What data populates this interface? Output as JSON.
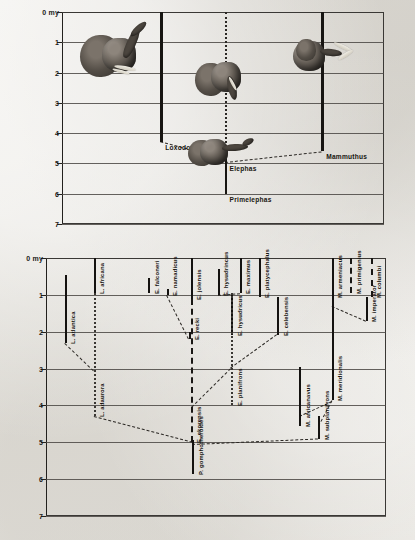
{
  "figure": {
    "axis_unit_label": "0 my",
    "tick_labels": [
      "0 my",
      "1",
      "2",
      "3",
      "4",
      "5",
      "6",
      "7"
    ],
    "colors": {
      "ink": "#171512",
      "grid": "#4a4743",
      "paper": "#e8e6e1"
    }
  },
  "chart_data": {
    "type": "range-chart",
    "title": "",
    "ylabel": "Millions of years (my)",
    "ylim": [
      0,
      7
    ],
    "y_inverted": true,
    "grid": true,
    "legend": "none",
    "panels": [
      {
        "name": "genus-panel",
        "ranges": [
          {
            "label": "Loxodonta",
            "from": 0.0,
            "to": 4.3,
            "style": "solid",
            "x_frac": 0.305
          },
          {
            "label": "Elephas",
            "from": 0.0,
            "to": 5.0,
            "style": "dotted",
            "x_frac": 0.505
          },
          {
            "label": "Mammuthus",
            "from": 0.0,
            "to": 4.6,
            "style": "solid",
            "x_frac": 0.805
          },
          {
            "label": "Primelephas",
            "from": 4.85,
            "to": 6.0,
            "style": "solid",
            "x_frac": 0.505
          }
        ],
        "lineages": [
          {
            "from": "Primelephas",
            "to": "Loxodonta",
            "x1_frac": 0.505,
            "y1": 4.85,
            "x2_frac": 0.305,
            "y2": 4.3
          },
          {
            "from": "Primelephas",
            "to": "Mammuthus",
            "x1_frac": 0.505,
            "y1": 4.95,
            "x2_frac": 0.805,
            "y2": 4.6
          }
        ],
        "illustrations": [
          {
            "name": "loxodonta-head",
            "x_frac": 0.17,
            "y": 1.45
          },
          {
            "name": "elephas-head",
            "x_frac": 0.5,
            "y": 2.25
          },
          {
            "name": "mammuthus-head",
            "x_frac": 0.82,
            "y": 1.5
          },
          {
            "name": "primelephas-head",
            "x_frac": 0.5,
            "y": 4.65
          }
        ]
      },
      {
        "name": "species-panel",
        "ranges": [
          {
            "label": "L. atlantica",
            "from": 0.45,
            "to": 2.3,
            "style": "solid",
            "x_frac": 0.055
          },
          {
            "label": "L. africana",
            "from": 0.0,
            "to": 0.95,
            "style": "solid",
            "x_frac": 0.14
          },
          {
            "label": "L. adaurora",
            "from": 0.95,
            "to": 4.3,
            "style": "dotted",
            "x_frac": 0.14
          },
          {
            "label": "E. falconeri",
            "from": 0.55,
            "to": 0.95,
            "style": "solid",
            "x_frac": 0.3
          },
          {
            "label": "E. namadicus",
            "from": 0.85,
            "to": 1.0,
            "style": "solid",
            "x_frac": 0.355
          },
          {
            "label": "E. recki",
            "from": 2.0,
            "to": 2.2,
            "style": "solid",
            "x_frac": 0.42
          },
          {
            "label": "E. jolensis",
            "from": 0.0,
            "to": 1.1,
            "style": "solid",
            "x_frac": 0.425
          },
          {
            "label": "E. ekorensis",
            "from": 1.1,
            "to": 5.0,
            "style": "dashed",
            "x_frac": 0.425
          },
          {
            "label": "E. hysudrincus",
            "from": 0.3,
            "to": 1.0,
            "style": "solid",
            "x_frac": 0.505
          },
          {
            "label": "E. hysudricus",
            "from": 1.0,
            "to": 2.1,
            "style": "solid",
            "x_frac": 0.545
          },
          {
            "label": "E. maximus",
            "from": 0.0,
            "to": 0.95,
            "style": "solid",
            "x_frac": 0.57
          },
          {
            "label": "E. planifrons",
            "from": 0.95,
            "to": 4.0,
            "style": "dotted",
            "x_frac": 0.545
          },
          {
            "label": "E. platycephalus",
            "from": 0.0,
            "to": 1.05,
            "style": "solid",
            "x_frac": 0.625
          },
          {
            "label": "E. celebensis",
            "from": 1.05,
            "to": 2.1,
            "style": "solid",
            "x_frac": 0.68
          },
          {
            "label": "M. africanavus",
            "from": 2.95,
            "to": 4.55,
            "style": "solid",
            "x_frac": 0.745
          },
          {
            "label": "M. subplanifrons",
            "from": 4.3,
            "to": 4.9,
            "style": "solid",
            "x_frac": 0.8
          },
          {
            "label": "M. armeniacus",
            "from": 0.0,
            "to": 1.05,
            "style": "solid",
            "x_frac": 0.84
          },
          {
            "label": "M. meridionalis",
            "from": 1.05,
            "to": 3.85,
            "style": "solid",
            "x_frac": 0.84
          },
          {
            "label": "M. primigenius",
            "from": 0.0,
            "to": 0.95,
            "style": "dashed",
            "x_frac": 0.895
          },
          {
            "label": "M. columbi",
            "from": 0.0,
            "to": 1.05,
            "style": "dashed",
            "x_frac": 0.955
          },
          {
            "label": "M. imperator",
            "from": 1.05,
            "to": 1.7,
            "style": "solid",
            "x_frac": 0.94
          },
          {
            "label": "P. gomphotheroides",
            "from": 4.95,
            "to": 5.85,
            "style": "solid",
            "x_frac": 0.43
          }
        ],
        "ancestry_links": [
          {
            "x1_frac": 0.055,
            "y1": 2.3,
            "x2_frac": 0.14,
            "y2": 3.05
          },
          {
            "x1_frac": 0.355,
            "y1": 1.0,
            "x2_frac": 0.42,
            "y2": 2.2
          },
          {
            "x1_frac": 0.505,
            "y1": 1.0,
            "x2_frac": 0.57,
            "y2": 0.95
          },
          {
            "x1_frac": 0.68,
            "y1": 2.1,
            "x2_frac": 0.545,
            "y2": 3.0
          },
          {
            "x1_frac": 0.545,
            "y1": 3.0,
            "x2_frac": 0.43,
            "y2": 4.05
          },
          {
            "x1_frac": 0.14,
            "y1": 4.3,
            "x2_frac": 0.43,
            "y2": 5.0
          },
          {
            "x1_frac": 0.43,
            "y1": 5.05,
            "x2_frac": 0.8,
            "y2": 4.9
          },
          {
            "x1_frac": 0.8,
            "y1": 4.55,
            "x2_frac": 0.84,
            "y2": 3.85
          },
          {
            "x1_frac": 0.745,
            "y1": 4.3,
            "x2_frac": 0.84,
            "y2": 3.9
          },
          {
            "x1_frac": 0.84,
            "y1": 1.3,
            "x2_frac": 0.94,
            "y2": 1.7
          }
        ]
      }
    ]
  }
}
